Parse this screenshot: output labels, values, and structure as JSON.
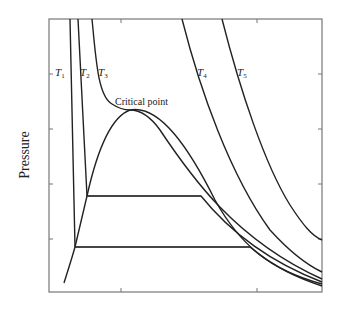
{
  "figure": {
    "type": "pressure-volume isotherm diagram",
    "ylabel": "Pressure",
    "xlabel": "",
    "annotation": "Critical point",
    "isotherms": [
      {
        "name": "T",
        "sub": "1",
        "label": "T1"
      },
      {
        "name": "T",
        "sub": "2",
        "label": "T2"
      },
      {
        "name": "T",
        "sub": "3",
        "label": "T3"
      },
      {
        "name": "T",
        "sub": "4",
        "label": "T4"
      },
      {
        "name": "T",
        "sub": "5",
        "label": "T5"
      }
    ],
    "colors": {
      "line": "#222222",
      "frame": "#777777",
      "background": "#ffffff"
    },
    "y_ticks": 4,
    "x_ticks": 2
  }
}
